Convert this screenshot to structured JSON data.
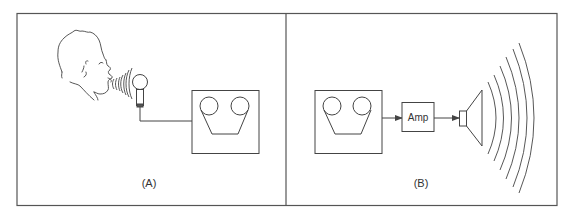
{
  "diagram": {
    "type": "audio recording and playback schematic",
    "stroke_color": "#444444",
    "background": "#ffffff",
    "panels": [
      {
        "id": "A",
        "label": "(A)",
        "description": "Person speaking into a microphone connected to a tape recorder",
        "elements": [
          "person-head",
          "sound-waves",
          "microphone",
          "cable",
          "tape-recorder"
        ]
      },
      {
        "id": "B",
        "label": "(B)",
        "description": "Tape recorder output to amplifier to loudspeaker emitting sound waves",
        "elements": [
          "tape-recorder",
          "arrow",
          "amplifier",
          "arrow",
          "loudspeaker",
          "sound-waves"
        ]
      }
    ],
    "amplifier": {
      "label": "Amp"
    }
  }
}
